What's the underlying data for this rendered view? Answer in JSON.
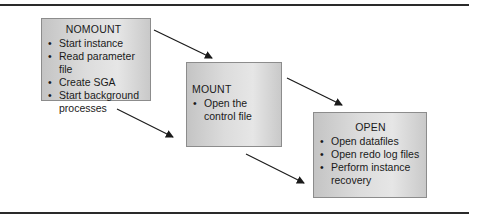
{
  "diagram": {
    "type": "flow",
    "direction": "left-to-right descending",
    "stages": [
      {
        "id": "nomount",
        "title": "NOMOUNT",
        "items": [
          "Start instance",
          "Read parameter file",
          "Create SGA",
          "Start background processes"
        ]
      },
      {
        "id": "mount",
        "title": "MOUNT",
        "items": [
          "Open the control file"
        ]
      },
      {
        "id": "open",
        "title": "OPEN",
        "items": [
          "Open datafiles",
          "Open redo log files",
          "Perform instance recovery"
        ]
      }
    ],
    "arrows": [
      {
        "from": "nomount",
        "to": "mount",
        "label": ""
      },
      {
        "from": "nomount",
        "to": "mount",
        "label": ""
      },
      {
        "from": "mount",
        "to": "open",
        "label": ""
      },
      {
        "from": "mount",
        "to": "open",
        "label": ""
      }
    ],
    "colors": {
      "box_fill": "#d8d8d8",
      "box_border": "#8c8c8c",
      "arrow": "#1a1a1a",
      "rule": "#2a2a2a"
    }
  }
}
